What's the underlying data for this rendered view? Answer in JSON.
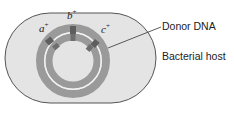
{
  "figure": {
    "type": "diagram",
    "labels": {
      "donor_dna": "Donor DNA",
      "bacterial_host": "Bacterial host"
    },
    "genes": [
      {
        "name": "a",
        "sign": "+"
      },
      {
        "name": "b",
        "sign": "+"
      },
      {
        "name": "c",
        "sign": "+"
      }
    ],
    "colors": {
      "cell_fill": "#e4e4e4",
      "cell_outline": "#555555",
      "dna_ring": "#9a9a9a",
      "gene_marker": "#5e5e5e",
      "leader_line": "#333333"
    }
  }
}
